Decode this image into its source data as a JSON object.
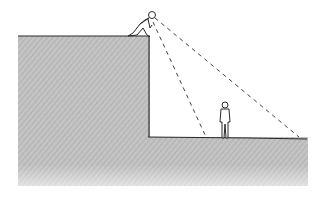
{
  "illustration": {
    "style": "pencil sketch",
    "subject": "observer on cliff edge looking down at a standing person on lower ground",
    "elements": {
      "cliff": {
        "fill": "#b8b8b8",
        "stroke": "#2a2a2a"
      },
      "lower_ground": {
        "fill": "#c2c2c2",
        "stroke": "#2a2a2a"
      },
      "observer": {
        "position": "cliff edge, crouching/leaning forward"
      },
      "standing_person": {
        "position": "lower ground"
      },
      "sight_lines": {
        "count": 2,
        "style": "dashed",
        "color": "#444444"
      }
    }
  }
}
